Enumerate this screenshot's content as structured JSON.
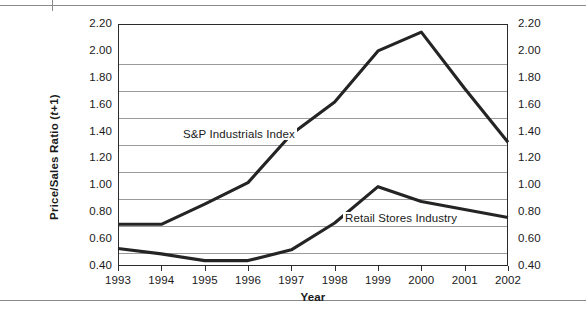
{
  "figure": {
    "rule_top": "horizontal-rule",
    "rule_bottom": "horizontal-rule"
  },
  "chart_data": {
    "type": "line",
    "title": "",
    "xlabel": "Year",
    "ylabel": "Price/Sales Ratio (t+1)",
    "ylabel_parts": {
      "main": "Price/Sales Ratio (",
      "italic": "t",
      "tail": "+1)"
    },
    "categories": [
      "1993",
      "1994",
      "1995",
      "1996",
      "1997",
      "1998",
      "1999",
      "2000",
      "2001",
      "2002"
    ],
    "ylim": [
      0.4,
      2.2
    ],
    "ytick_labels": [
      "2.20",
      "2.00",
      "1.80",
      "1.60",
      "1.40",
      "1.20",
      "1.00",
      "0.80",
      "0.60",
      "0.40"
    ],
    "ytick_values": [
      2.2,
      2.0,
      1.8,
      1.6,
      1.4,
      1.2,
      1.0,
      0.8,
      0.6,
      0.4
    ],
    "gridlines": [
      1.9,
      1.7,
      1.5,
      1.3,
      1.1,
      0.9,
      0.7,
      0.5
    ],
    "grid": true,
    "legend_position": "inline-annotation",
    "axis_labels_both_sides": true,
    "series": [
      {
        "name": "S&P Industrials Index",
        "color": "#242424",
        "values": [
          0.71,
          0.71,
          0.86,
          1.02,
          1.38,
          1.62,
          2.0,
          2.14,
          1.72,
          1.32
        ]
      },
      {
        "name": "Retail Stores Industry",
        "color": "#242424",
        "values": [
          0.53,
          0.49,
          0.44,
          0.44,
          0.52,
          0.72,
          0.99,
          0.88,
          0.82,
          0.76
        ]
      }
    ]
  },
  "colors": {
    "series_stroke": "#242424",
    "gridline": "#9b9b9b",
    "frame": "#2b2b2b",
    "doc_rule": "#8a8a8a",
    "text": "#1a1a1a",
    "background": "#ffffff"
  }
}
